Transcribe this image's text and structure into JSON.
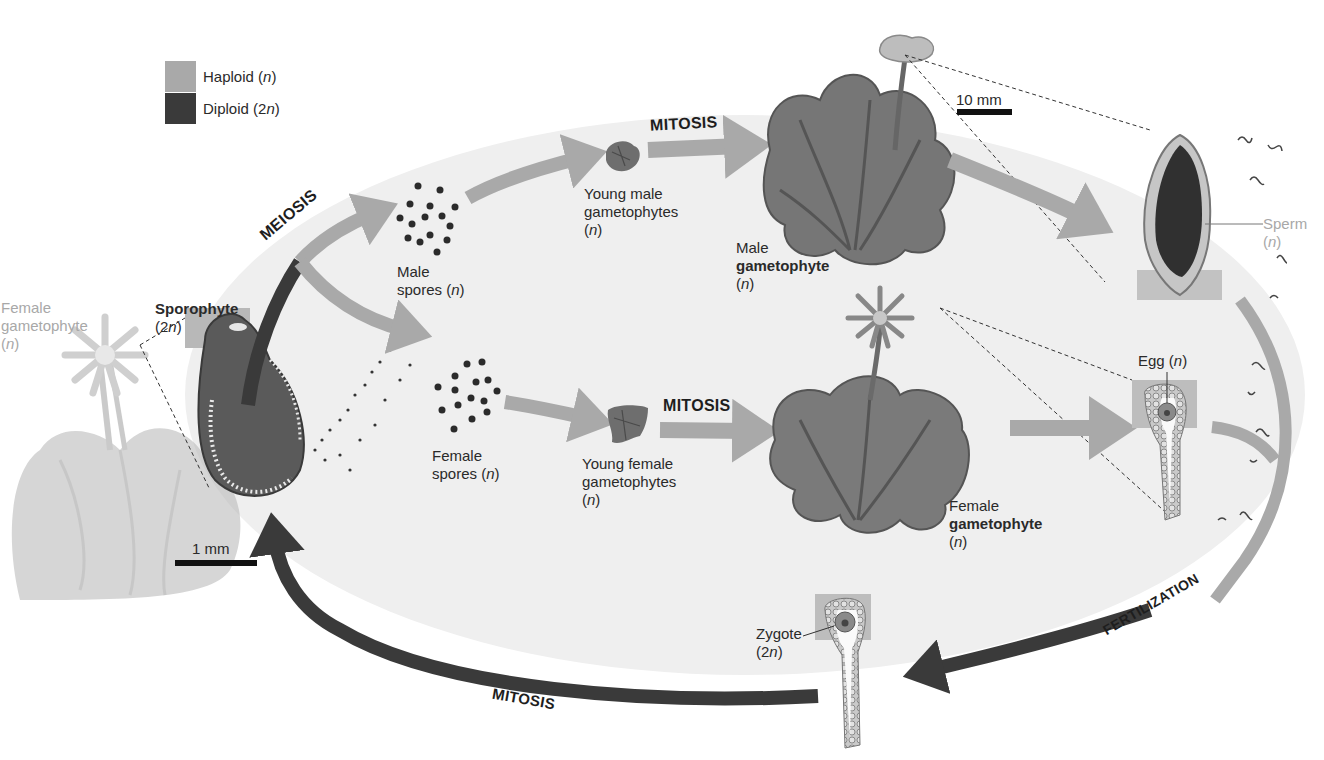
{
  "diagram": {
    "type": "life-cycle",
    "colors": {
      "haploid": "#a9a9a9",
      "diploid": "#3a3a3a",
      "background_oval": "#efefef",
      "text": "#2a2a2a",
      "faint_text": "#a8a8a8"
    },
    "legend": {
      "items": [
        {
          "label": "Haploid",
          "suffix": "(n)",
          "text": "Haploid (n)",
          "color": "#a9a9a9"
        },
        {
          "label": "Diploid",
          "suffix": "(2n)",
          "text": "Diploid (2n)",
          "color": "#3a3a3a"
        }
      ]
    },
    "processes": {
      "meiosis": "MEIOSIS",
      "mitosis_male": "MITOSIS",
      "mitosis_female": "MITOSIS",
      "mitosis_bottom": "MITOSIS",
      "fertilization": "FERTILIZATION"
    },
    "labels": {
      "male_spores": {
        "line1": "Male",
        "line2": "spores (n)"
      },
      "female_spores": {
        "line1": "Female",
        "line2": "spores (n)"
      },
      "young_male": {
        "line1": "Young male",
        "line2": "gametophytes",
        "line3": "(n)"
      },
      "young_female": {
        "line1": "Young female",
        "line2": "gametophytes",
        "line3": "(n)"
      },
      "male_gametophyte": {
        "line1": "Male",
        "line2": "gametophyte",
        "line3": "(n)"
      },
      "female_gametophyte": {
        "line1": "Female",
        "line2": "gametophyte",
        "line3": "(n)"
      },
      "sperm": {
        "line1": "Sperm",
        "line2": "(n)"
      },
      "egg": {
        "text": "Egg (n)"
      },
      "zygote": {
        "line1": "Zygote",
        "line2": "(2n)"
      },
      "sporophyte": {
        "line1": "Sporophyte",
        "line2": "(2n)"
      },
      "female_gametophyte_inset": {
        "line1": "Female",
        "line2": "gametophyte",
        "line3": "(n)"
      }
    },
    "scale_bars": {
      "top": "10 mm",
      "bottom_left": "1 mm"
    }
  }
}
